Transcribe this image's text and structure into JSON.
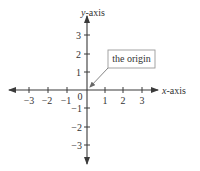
{
  "diagram": {
    "type": "cartesian-axes",
    "x_axis": {
      "label_italic": "x",
      "label_rest": "-axis",
      "ticks": [
        "−3",
        "−2",
        "−1",
        "1",
        "2",
        "3"
      ]
    },
    "y_axis": {
      "label_italic": "y",
      "label_rest": "-axis",
      "ticks": [
        "3",
        "2",
        "1",
        "−1",
        "−2",
        "−3"
      ]
    },
    "origin_label": "0",
    "callout": {
      "text": "the origin"
    },
    "colors": {
      "axis": "#3a3a3a",
      "text": "#333333",
      "box_border": "#9a9a9a"
    }
  }
}
